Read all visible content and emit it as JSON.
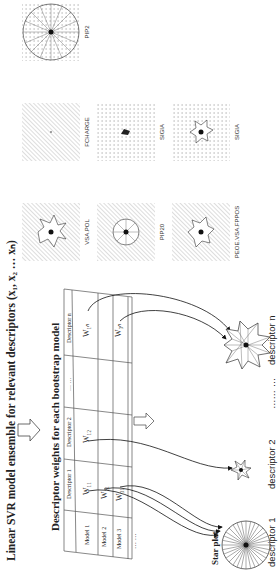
{
  "figure": {
    "orientation": "rotated 90 degrees counter-clockwise",
    "title": "Linear SVR model ensemble for relevant descriptors (x₁, x₂ … xₙ)",
    "subtitle": "Descriptor weights for each bootstrap model",
    "table": {
      "columns": [
        "",
        "Descriptor 1",
        "Descriptor 2",
        "… …",
        "Descriptor n"
      ],
      "rows": [
        {
          "label": "Model 1",
          "cells": [
            "W₁₁",
            "W₁₂",
            "",
            "W₁ₙ"
          ]
        },
        {
          "label": "Model 2",
          "cells": [
            "W₂₁",
            "",
            "",
            ""
          ]
        },
        {
          "label": "Model 3",
          "cells": [
            "W₃₁",
            "",
            "",
            "W₃ₙ"
          ]
        },
        {
          "label": "… …",
          "cells": [
            "",
            "",
            "",
            ""
          ]
        }
      ]
    },
    "star_plot_label": "Star plot",
    "star_plots": [
      {
        "label": "descriptor 1"
      },
      {
        "label": "descriptor 2"
      },
      {
        "label": "…… …"
      },
      {
        "label": "descriptor n"
      }
    ],
    "examples": [
      {
        "label": "VSA.POL",
        "background": "hatched"
      },
      {
        "label": "FCHARGE",
        "background": "hatched"
      },
      {
        "label": "PIP2",
        "background": "dotted"
      },
      {
        "label": "PIP20",
        "background": "hatched"
      },
      {
        "label": "SIGIA",
        "background": "dotted"
      },
      {
        "label": "PEOE.VSA.FPPOS",
        "background": "hatched"
      },
      {
        "label": "SIGIA",
        "background": "dotted"
      }
    ]
  }
}
